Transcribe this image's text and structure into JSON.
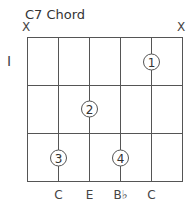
{
  "title": "C7 Chord",
  "fret_number": "I",
  "muted_strings": [
    {
      "label": "X",
      "string": 1
    },
    {
      "label": "X",
      "string": 6
    }
  ],
  "grid": {
    "strings": 6,
    "frets": 3
  },
  "fingers": [
    {
      "label": "1",
      "string": 5,
      "fret": 1
    },
    {
      "label": "2",
      "string": 3,
      "fret": 2
    },
    {
      "label": "3",
      "string": 2,
      "fret": 3
    },
    {
      "label": "4",
      "string": 4,
      "fret": 3
    }
  ],
  "notes": [
    {
      "label": "C",
      "string": 2
    },
    {
      "label": "E",
      "string": 3
    },
    {
      "label": "B♭",
      "string": 4
    },
    {
      "label": "C",
      "string": 5
    }
  ]
}
